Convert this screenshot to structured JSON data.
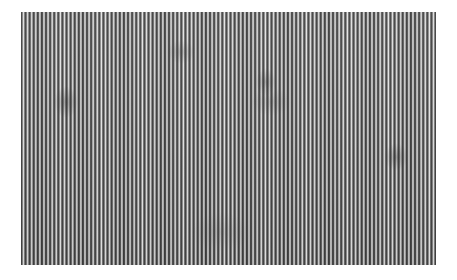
{
  "image": {
    "subject": "vertical line grating texture",
    "colors": {
      "dark_stripe": "#3c3c3c",
      "light_stripe": "#e4e4e4",
      "background": "#ffffff"
    },
    "stripe_period_px": 4.1
  }
}
